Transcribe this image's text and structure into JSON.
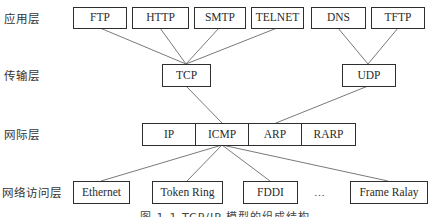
{
  "layers": {
    "application": "应用层",
    "transport": "传输层",
    "internet": "网际层",
    "network_access": "网络访问层"
  },
  "application_protocols": [
    "FTP",
    "HTTP",
    "SMTP",
    "TELNET",
    "DNS",
    "TFTP"
  ],
  "transport_protocols": [
    "TCP",
    "UDP"
  ],
  "internet_protocols": [
    "IP",
    "ICMP",
    "ARP",
    "RARP"
  ],
  "network_access_protocols": [
    "Ethernet",
    "Token Ring",
    "FDDI",
    "…",
    "Frame Ralay"
  ],
  "caption": "图 1-1 TCP/IP 模型的组成结构",
  "colors": {
    "box_border": "#2e2e2e",
    "line": "#6a6a6a",
    "text": "#2b2b2b",
    "background": "#ffffff"
  }
}
